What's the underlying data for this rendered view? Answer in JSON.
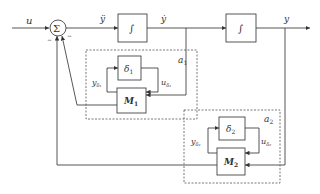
{
  "diagram": {
    "type": "block-diagram",
    "signals": {
      "input": "u",
      "acceleration": "ÿ",
      "velocity": "ẏ",
      "output": "y"
    },
    "summing_junction": {
      "symbol": "Σ",
      "signs": [
        "−",
        "−"
      ]
    },
    "integrators": [
      {
        "id": "int1",
        "symbol": "∫"
      },
      {
        "id": "int2",
        "symbol": "∫"
      }
    ],
    "uncertainty_blocks": [
      {
        "id": "a1",
        "label": "a",
        "label_sub": "1",
        "delta": "δ",
        "delta_sub": "1",
        "M": "M",
        "M_sub": "1",
        "y_delta": "y",
        "y_delta_sub": "δ₁",
        "u_delta": "u",
        "u_delta_sub": "δ₁"
      },
      {
        "id": "a2",
        "label": "a",
        "label_sub": "2",
        "delta": "δ",
        "delta_sub": "2",
        "M": "M",
        "M_sub": "2",
        "y_delta": "y",
        "y_delta_sub": "δ₂",
        "u_delta": "u",
        "u_delta_sub": "δ₂"
      }
    ]
  }
}
